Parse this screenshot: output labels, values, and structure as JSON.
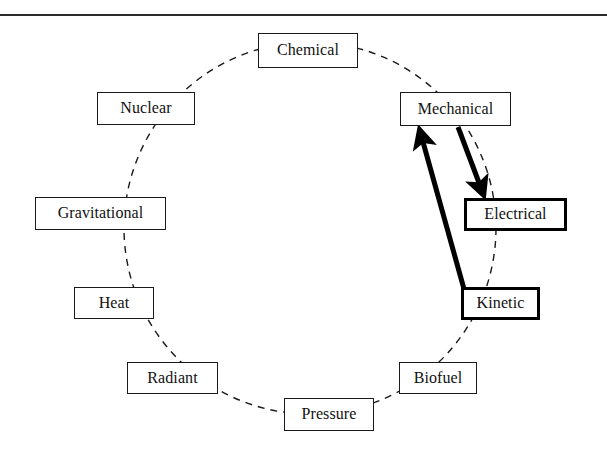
{
  "page": {
    "width": 607,
    "height": 461,
    "background_color": "#ffffff",
    "has_top_rule": true
  },
  "diagram": {
    "type": "cycle-diagram",
    "title": "",
    "circle": {
      "center_x": 310,
      "center_y": 228,
      "radius": 186,
      "stroke_color": "#1a1a1a",
      "stroke_style": "dashed",
      "stroke_width": 1.4,
      "dash_pattern": "7 6"
    },
    "nodes": [
      {
        "id": "chemical",
        "label": "Chemical",
        "x": 258,
        "y": 33,
        "width": 100,
        "height": 35,
        "emphasis": false
      },
      {
        "id": "mechanical",
        "label": "Mechanical",
        "x": 400,
        "y": 92,
        "width": 111,
        "height": 34,
        "emphasis": false
      },
      {
        "id": "electrical",
        "label": "Electrical",
        "x": 464,
        "y": 198,
        "width": 103,
        "height": 33,
        "emphasis": true
      },
      {
        "id": "kinetic",
        "label": "Kinetic",
        "x": 461,
        "y": 287,
        "width": 79,
        "height": 33,
        "emphasis": true
      },
      {
        "id": "biofuel",
        "label": "Biofuel",
        "x": 399,
        "y": 362,
        "width": 78,
        "height": 32,
        "emphasis": false
      },
      {
        "id": "pressure",
        "label": "Pressure",
        "x": 284,
        "y": 398,
        "width": 90,
        "height": 33,
        "emphasis": false
      },
      {
        "id": "radiant",
        "label": "Radiant",
        "x": 127,
        "y": 362,
        "width": 91,
        "height": 32,
        "emphasis": false
      },
      {
        "id": "heat",
        "label": "Heat",
        "x": 74,
        "y": 287,
        "width": 80,
        "height": 32,
        "emphasis": false
      },
      {
        "id": "gravitational",
        "label": "Gravitational",
        "x": 35,
        "y": 197,
        "width": 131,
        "height": 33,
        "emphasis": false
      },
      {
        "id": "nuclear",
        "label": "Nuclear",
        "x": 97,
        "y": 92,
        "width": 98,
        "height": 33,
        "emphasis": false
      }
    ],
    "arrows": [
      {
        "id": "kinetic-to-mechanical",
        "from": "kinetic",
        "to": "mechanical",
        "x1": 464,
        "y1": 289,
        "x2": 419,
        "y2": 128,
        "stroke_color": "#000000",
        "stroke_width": 5,
        "direction": "up"
      },
      {
        "id": "mechanical-to-electrical",
        "from": "mechanical",
        "to": "electrical",
        "x1": 458,
        "y1": 127,
        "x2": 484,
        "y2": 197,
        "stroke_color": "#000000",
        "stroke_width": 5,
        "direction": "down"
      }
    ]
  }
}
